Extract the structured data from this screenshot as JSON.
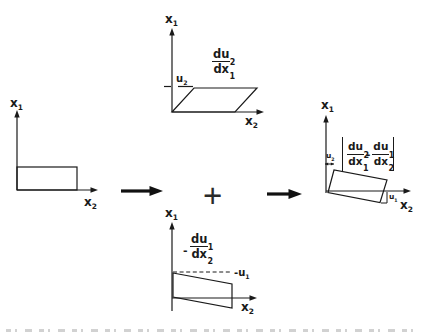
{
  "diagrams": {
    "initial": {
      "y_label": {
        "main": "x",
        "sub": "1"
      },
      "x_label": {
        "main": "x",
        "sub": "2"
      }
    },
    "shear_du2dx1": {
      "y_label": {
        "main": "x",
        "sub": "1"
      },
      "x_label": {
        "main": "x",
        "sub": "2"
      },
      "u_label": {
        "main": "u",
        "sub": "2"
      },
      "gradient": {
        "num_main": "du",
        "num_sub": "2",
        "den_main": "dx",
        "den_sub": "1"
      }
    },
    "shear_du1dx2": {
      "y_label": {
        "main": "x",
        "sub": "1"
      },
      "x_label": {
        "main": "x",
        "sub": "2"
      },
      "u_label": {
        "main": "-u",
        "sub": "1"
      },
      "gradient_sign": "-",
      "gradient": {
        "num_main": "du",
        "num_sub": "1",
        "den_main": "dx",
        "den_sub": "2"
      }
    },
    "rotation": {
      "y_label": {
        "main": "x",
        "sub": "1"
      },
      "x_label": {
        "main": "x",
        "sub": "2"
      },
      "u2_label": {
        "main": "u",
        "sub": "2"
      },
      "u1_label": {
        "main": "u",
        "sub": "1"
      },
      "expression": {
        "frac1": {
          "num_main": "du",
          "num_sub": "2",
          "den_main": "dx",
          "den_sub": "1"
        },
        "minus": "-",
        "frac2": {
          "num_main": "du",
          "num_sub": "1",
          "den_main": "dx",
          "den_sub": "2"
        }
      }
    }
  },
  "operators": {
    "plus": "+"
  },
  "colors": {
    "ink": "#1a1a1a",
    "background": "#ffffff"
  }
}
